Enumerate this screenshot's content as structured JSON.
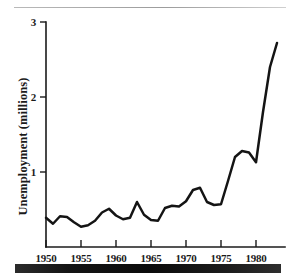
{
  "figure": {
    "name": "unemployment-line-chart",
    "has_top_rule": true,
    "has_bottom_scan_band": true
  },
  "axes": {
    "y_title": "Unemployment (millions)",
    "x_tick_labels": [
      "1950",
      "1955",
      "1960",
      "1965",
      "1970",
      "1975",
      "1980"
    ],
    "y_tick_labels": [
      "1",
      "2",
      "3"
    ]
  },
  "chart_data": {
    "type": "line",
    "title": "",
    "xlabel": "",
    "ylabel": "Unemployment (millions)",
    "xlim": [
      1949,
      1983.5
    ],
    "ylim": [
      0,
      3
    ],
    "yticks": [
      1,
      2,
      3
    ],
    "xticks": [
      1950,
      1955,
      1960,
      1965,
      1970,
      1975,
      1980
    ],
    "grid": false,
    "legend": false,
    "line_color": "#141414",
    "units": "millions",
    "x": [
      1950,
      1951,
      1952,
      1953,
      1954,
      1955,
      1956,
      1957,
      1958,
      1959,
      1960,
      1961,
      1962,
      1963,
      1964,
      1965,
      1966,
      1967,
      1968,
      1969,
      1970,
      1971,
      1972,
      1973,
      1974,
      1975,
      1976,
      1977,
      1978,
      1979,
      1980,
      1981,
      1982,
      1983
    ],
    "values": [
      0.39,
      0.31,
      0.41,
      0.4,
      0.33,
      0.27,
      0.29,
      0.35,
      0.46,
      0.51,
      0.42,
      0.37,
      0.39,
      0.6,
      0.43,
      0.36,
      0.35,
      0.52,
      0.55,
      0.54,
      0.61,
      0.76,
      0.79,
      0.6,
      0.56,
      0.57,
      0.88,
      1.2,
      1.28,
      1.26,
      1.13,
      1.8,
      2.4,
      2.72
    ],
    "series": [
      {
        "name": "Unemployment",
        "values": [
          0.39,
          0.31,
          0.41,
          0.4,
          0.33,
          0.27,
          0.29,
          0.35,
          0.46,
          0.51,
          0.42,
          0.37,
          0.39,
          0.6,
          0.43,
          0.36,
          0.35,
          0.52,
          0.55,
          0.54,
          0.61,
          0.76,
          0.79,
          0.6,
          0.56,
          0.57,
          0.88,
          1.2,
          1.28,
          1.26,
          1.13,
          1.8,
          2.4,
          2.72
        ]
      }
    ]
  }
}
